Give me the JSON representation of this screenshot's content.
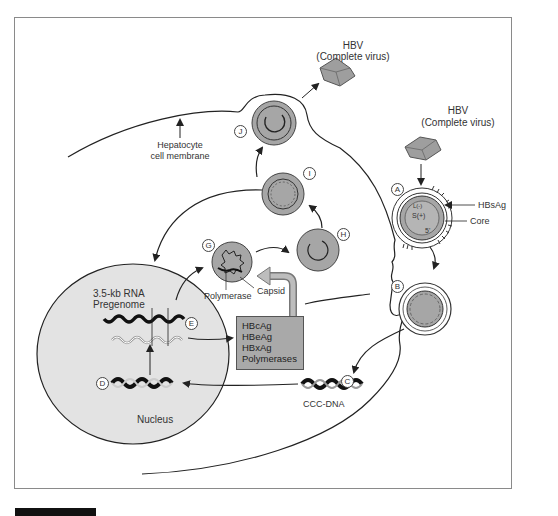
{
  "diagram": {
    "type": "hbv-replication-cycle",
    "labels": {
      "hbv_top": "HBV",
      "hbv_top_sub": "(Complete virus)",
      "hbv_right": "HBV",
      "hbv_right_sub": "(Complete virus)",
      "membrane_line1": "Hepatocyte",
      "membrane_line2": "cell membrane",
      "hbsag": "HBsAg",
      "core": "Core",
      "rna_line1": "3.5-kb RNA",
      "rna_line2": "Pregenome",
      "polymerase": "Polymerase",
      "capsid": "Capsid",
      "cccdna": "CCC-DNA",
      "nucleus": "Nucleus",
      "core_minus": "L(-)",
      "core_plus": "S(+)",
      "core_5": "5'"
    },
    "steps": [
      "A",
      "B",
      "C",
      "D",
      "E",
      "F",
      "G",
      "H",
      "I",
      "J"
    ],
    "protein_box": [
      "HBcAg",
      "HBeAg",
      "HBxAg",
      "Polymerases"
    ],
    "colors": {
      "particle_fill": "#a6a6a6",
      "nucleus_fill": "#e3e3e3",
      "box_fill": "#a9a9a9",
      "line": "#222222"
    }
  }
}
